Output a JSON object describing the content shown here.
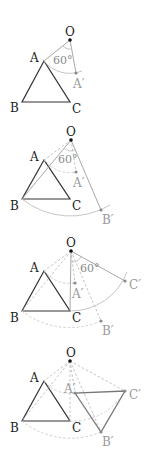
{
  "diagram": {
    "center_label": "O",
    "angle_label": "60°",
    "original_labels": {
      "A": "A",
      "B": "B",
      "C": "C"
    },
    "image_labels": {
      "A": "A′",
      "B": "B′",
      "C": "C′"
    },
    "steps": [
      {
        "step": 1,
        "description": "Rotate A about O by 60° to get A′"
      },
      {
        "step": 2,
        "description": "Rotate B about O by 60° to get B′"
      },
      {
        "step": 3,
        "description": "Rotate C about O by 60° to get C′"
      },
      {
        "step": 4,
        "description": "Connect A′, B′, C′ to form the rotated triangle"
      }
    ],
    "colors": {
      "original": "#333333",
      "construction": "#a8a8a8",
      "image": "#777777"
    }
  }
}
